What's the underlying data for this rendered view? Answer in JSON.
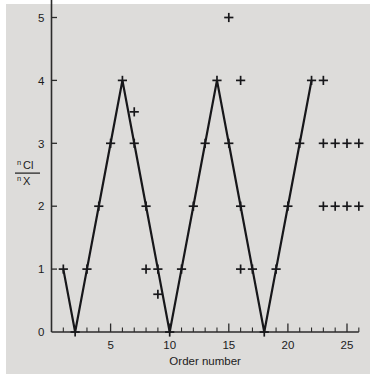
{
  "chart_data": {
    "type": "line",
    "title": "",
    "subtitle": "",
    "xlabel": "Order number",
    "ylabel_numerator": "Cl",
    "ylabel_denominator": "X",
    "ylabel_numerator_sup": "n",
    "ylabel_denominator_sup": "n",
    "ylabel_text": "nCl / nX",
    "xlim": [
      0,
      26
    ],
    "ylim": [
      0,
      5.25
    ],
    "grid": false,
    "legend": "none",
    "marker_style": "plus",
    "xticks": [
      5,
      10,
      15,
      20,
      25
    ],
    "xtick_labels": [
      "5",
      "10",
      "15",
      "20",
      "25"
    ],
    "xticks_minor": [
      1,
      2,
      3,
      4,
      6,
      7,
      8,
      9,
      11,
      12,
      13,
      14,
      16,
      17,
      18,
      19,
      21,
      22,
      23,
      24,
      26
    ],
    "yticks": [
      0,
      1,
      2,
      3,
      4,
      5
    ],
    "ytick_labels": [
      "0",
      "1",
      "2",
      "3",
      "4",
      "5"
    ],
    "series": [
      {
        "name": "connected-zigzag",
        "connected": true,
        "x": [
          1,
          2,
          3,
          4,
          5,
          6,
          7,
          8,
          9,
          10,
          11,
          12,
          13,
          14,
          15,
          16,
          17,
          18,
          19,
          20,
          21,
          22
        ],
        "y": [
          1,
          0,
          1,
          2,
          3,
          4,
          3,
          2,
          1,
          0,
          1,
          2,
          3,
          4,
          3,
          2,
          1,
          0,
          1,
          2,
          3,
          4
        ]
      },
      {
        "name": "scattered-extra-points",
        "connected": false,
        "x": [
          7,
          8,
          9,
          15,
          16,
          16,
          23,
          23,
          24,
          25,
          26,
          23,
          24,
          25,
          26
        ],
        "y": [
          3.5,
          1,
          0.6,
          5,
          4,
          1,
          4,
          3,
          3,
          3,
          3,
          2,
          2,
          2,
          2
        ]
      }
    ]
  },
  "axis": {
    "x_axis_name": "x-axis",
    "y_axis_name": "y-axis"
  }
}
